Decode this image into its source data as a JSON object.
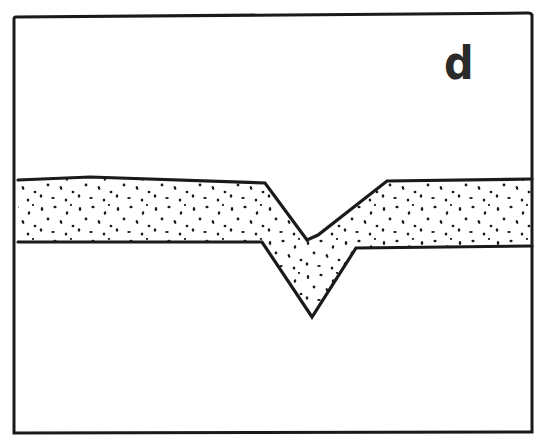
{
  "figure": {
    "panel_label": "d",
    "colors": {
      "background": "#ffffff",
      "ink": "#1a1a1a",
      "label": "#2a2a2a"
    },
    "frame": {
      "x1": 14,
      "y1": 16,
      "x2": 532,
      "y2": 433
    },
    "layer": {
      "fill_pattern": "stipple-dots",
      "upper_boundary": [
        [
          18,
          180
        ],
        [
          90,
          177
        ],
        [
          265,
          183
        ],
        [
          307,
          240
        ],
        [
          318,
          235
        ],
        [
          387,
          181
        ],
        [
          532,
          179
        ]
      ],
      "lower_boundary": [
        [
          18,
          242
        ],
        [
          262,
          242
        ],
        [
          312,
          317
        ],
        [
          356,
          248
        ],
        [
          532,
          246
        ]
      ]
    }
  }
}
